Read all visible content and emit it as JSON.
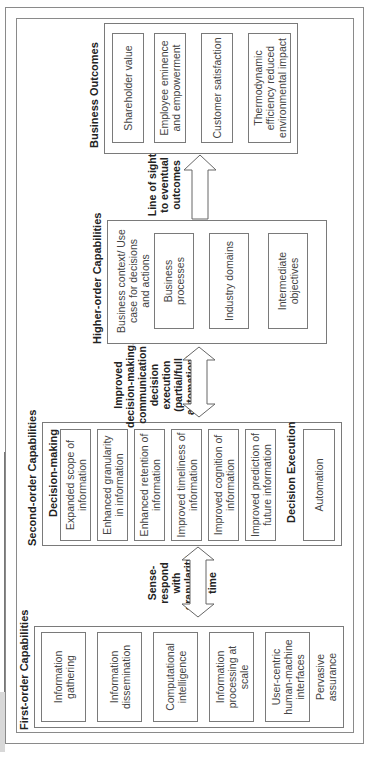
{
  "orientation": "rotated-90-ccw",
  "first_order": {
    "title": "First-order Capabilities",
    "items": [
      "Information gathering",
      "Information dissemination",
      "Computational intelligence",
      "Information processing at scale",
      "User-centric human-machine interfaces"
    ],
    "extra": "Pervasive assurance"
  },
  "arrow1": {
    "label_lines": [
      "Sense-respond",
      "with granularity",
      "in near real time"
    ],
    "type": "double"
  },
  "second_order": {
    "title": "Second-order Capabilities",
    "decision_making": {
      "title": "Decision-making",
      "items": [
        "Expanded scope of information",
        "Enhanced granularity in information",
        "Enhanced retention of information",
        "Improved timeliness of information",
        "Improved cognition of information",
        "Improved prediction of future information"
      ]
    },
    "decision_execution": {
      "title": "Decision Execution",
      "items": [
        "Automation"
      ]
    }
  },
  "arrow2": {
    "label_lines": [
      "Improved",
      "decision-making,",
      "communication",
      "decision",
      "execution",
      "(partial/full",
      "automation)"
    ],
    "type": "double"
  },
  "higher_order": {
    "title": "Higher-order Capabilities",
    "context": "Business context/ Use case for decisions and actions",
    "items": [
      "Business processes",
      "Industry domains",
      "Intermediate objectives"
    ]
  },
  "arrow3": {
    "label_lines": [
      "Line of sight",
      "to eventual",
      "outcomes"
    ],
    "type": "single"
  },
  "business_outcomes": {
    "title": "Business Outcomes",
    "items": [
      "Shareholder value",
      "Employee eminence and empowerment",
      "Customer satisfaction",
      "Thermodynamic efficiency reduced environmental impact"
    ]
  },
  "colors": {
    "border": "#7a7a7a",
    "text": "#444444",
    "title": "#222222",
    "strip": "#d8d8d8"
  }
}
